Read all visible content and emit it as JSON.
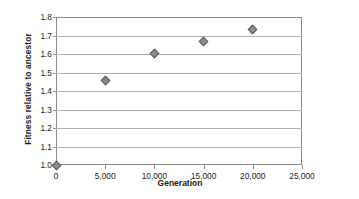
{
  "chart_data": {
    "type": "scatter",
    "title": "",
    "xlabel": "Generation",
    "ylabel": "Fitness relative to ancestor",
    "xlim": [
      0,
      25000
    ],
    "ylim": [
      1.0,
      1.8
    ],
    "grid": "horizontal",
    "legend": "none",
    "x_ticks": [
      0,
      5000,
      10000,
      15000,
      20000,
      25000
    ],
    "x_tick_labels": [
      "0",
      "5,000",
      "10,000",
      "15,000",
      "20,000",
      "25,000"
    ],
    "y_ticks": [
      1.0,
      1.1,
      1.2,
      1.3,
      1.4,
      1.5,
      1.6,
      1.7,
      1.8
    ],
    "y_tick_labels": [
      "1.0",
      "1.1",
      "1.2",
      "1.3",
      "1.4",
      "1.5",
      "1.6",
      "1.7",
      "1.8"
    ],
    "series": [
      {
        "name": "Fitness",
        "marker": "diamond",
        "color": "#8c8c8c",
        "x": [
          0,
          5000,
          10000,
          15000,
          20000
        ],
        "y": [
          1.0,
          1.455,
          1.605,
          1.665,
          1.73
        ]
      }
    ]
  }
}
